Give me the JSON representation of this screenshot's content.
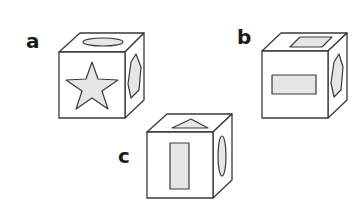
{
  "diagram": {
    "type": "cube-net-puzzle",
    "colors": {
      "stroke": "#3a3a3a",
      "shape_fill": "#e6e6e6",
      "face_fill": "#ffffff",
      "label": "#1a1a1a"
    },
    "cubes": [
      {
        "label": "a",
        "front": "star",
        "top": "ellipse",
        "right": "hexagon"
      },
      {
        "label": "b",
        "front": "rectangle",
        "top": "parallelogram",
        "right": "hexagon"
      },
      {
        "label": "c",
        "front": "vertical rectangle",
        "top": "triangle",
        "right": "ellipse"
      }
    ]
  }
}
